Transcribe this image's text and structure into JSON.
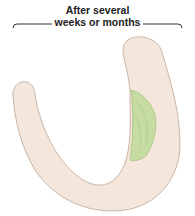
{
  "caption": {
    "line1": "After several",
    "line2": "weeks or months"
  },
  "figure": {
    "shape": "u-shaped-tube-cross-section",
    "fill_color": "#f5e6dc",
    "outline_color": "#c9b6a6",
    "lesion_color": "#b7d48e",
    "lesion_outline_color": "#8fb86a"
  }
}
